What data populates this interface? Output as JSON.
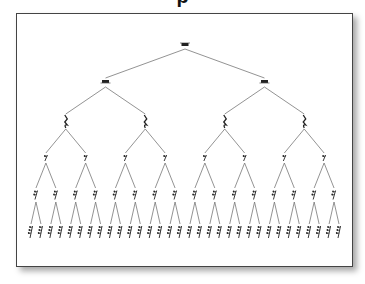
{
  "diagram": {
    "type": "binary-tree",
    "line_color": "#777777",
    "rest_color": "#222222",
    "levels": [
      {
        "name": "whole-rest",
        "symbol": "whole",
        "count": 1,
        "y": 46
      },
      {
        "name": "half-rest",
        "symbol": "half",
        "count": 2,
        "y": 83
      },
      {
        "name": "quarter-rest",
        "symbol": "quarter",
        "count": 4,
        "y": 122
      },
      {
        "name": "eighth-rest",
        "symbol": "eighth",
        "count": 8,
        "y": 158
      },
      {
        "name": "sixteenth-rest",
        "symbol": "sixteenth",
        "count": 16,
        "y": 195
      },
      {
        "name": "thirty-second-rest",
        "symbol": "thirtysecond",
        "count": 32,
        "y": 232
      }
    ],
    "x_start": 31,
    "x_end": 339
  }
}
